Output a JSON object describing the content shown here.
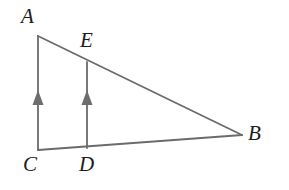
{
  "figure": {
    "kind": "geometry-diagram",
    "background_color": "#ffffff",
    "stroke_color": "#6b6b6b",
    "arrow_color": "#6e6e6e",
    "label_color": "#1c1c1c",
    "stroke_width": 1.8,
    "labels": {
      "a": "A",
      "e": "E",
      "b": "B",
      "c": "C",
      "d": "D"
    },
    "points": {
      "A": {
        "x": 38,
        "y": 36
      },
      "B": {
        "x": 242,
        "y": 135
      },
      "C": {
        "x": 38,
        "y": 150
      },
      "D": {
        "x": 87,
        "y": 148
      },
      "E": {
        "x": 87,
        "y": 62
      }
    },
    "segments": [
      {
        "name": "segment-AB",
        "from": "A",
        "to": "B"
      },
      {
        "name": "segment-CB",
        "from": "C",
        "to": "B"
      },
      {
        "name": "segment-CA",
        "from": "C",
        "to": "A"
      },
      {
        "name": "segment-DE",
        "from": "D",
        "to": "E"
      }
    ],
    "tick_marks": [
      {
        "name": "parallel-arrow-CA",
        "x": 38,
        "y": 98
      },
      {
        "name": "parallel-arrow-DE",
        "x": 87,
        "y": 98
      }
    ]
  }
}
